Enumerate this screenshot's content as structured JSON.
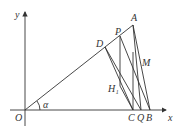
{
  "labels": {
    "y": "y",
    "x": "x",
    "O": "O",
    "alpha": "α",
    "A": "A",
    "P": "P",
    "D": "D",
    "M": "M",
    "H1": "H₁",
    "C": "C",
    "Q": "Q",
    "B": "B"
  },
  "colors": {
    "line": "#333333",
    "background": "#ffffff"
  }
}
